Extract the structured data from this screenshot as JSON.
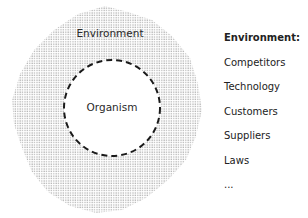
{
  "diagram": {
    "outer_label": "Environment",
    "inner_label": "Organism",
    "outer_fill_pattern": "dots",
    "dot_color": "#9a9a9a",
    "inner_border_color": "#1a1a1a",
    "inner_border_style": "dashed"
  },
  "legend": {
    "heading": "Environment:",
    "items": [
      "Competitors",
      "Technology",
      "Customers",
      "Suppliers",
      "Laws",
      "..."
    ]
  }
}
